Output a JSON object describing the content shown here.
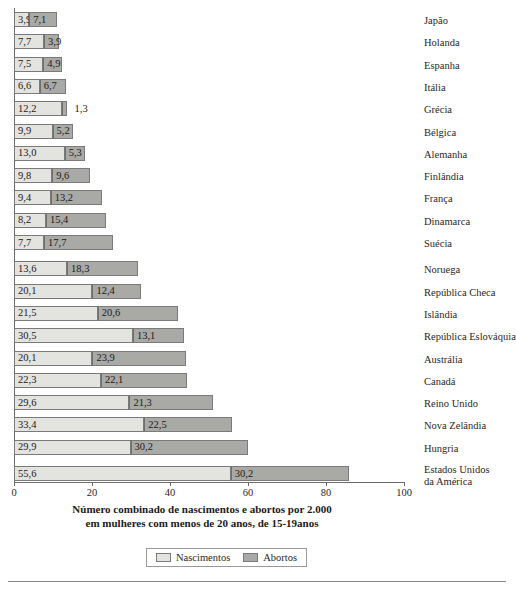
{
  "chart_data": {
    "type": "bar",
    "orientation": "horizontal",
    "stacked": true,
    "title": "",
    "xlabel": "Número combinado de nascimentos e abortos por 2.000 em mulheres com menos de 20 anos, de 15-19anos",
    "xlabel_line1": "Número combinado de nascimentos e abortos por 2.000",
    "xlabel_line2": "em mulheres com menos de 20 anos, de 15-19anos",
    "ylabel": "",
    "xlim": [
      0,
      100
    ],
    "xticks": [
      0,
      20,
      40,
      60,
      80,
      100
    ],
    "grid": false,
    "legend_position": "bottom",
    "colors": {
      "births": "#e3e3e0",
      "abortions": "#a9a9a6",
      "border": "#7a7a78",
      "axis": "#6e6a67",
      "text": "#2b2726"
    },
    "categories": [
      "Japão",
      "Holanda",
      "Espanha",
      "Itália",
      "Grécia",
      "Bélgica",
      "Alemanha",
      "Finlândia",
      "França",
      "Dinamarca",
      "Suécia",
      "Noruega",
      "República Checa",
      "Islândia",
      "República Eslováquia",
      "Austrália",
      "Canadá",
      "Reino Unido",
      "Nova Zelândia",
      "Hungria",
      "Estados Unidos da América"
    ],
    "series": [
      {
        "name": "Nascimentos",
        "values": [
          3.9,
          7.7,
          7.5,
          6.6,
          12.2,
          9.9,
          13.0,
          9.8,
          9.4,
          8.2,
          7.7,
          13.6,
          20.1,
          21.5,
          30.5,
          20.1,
          22.3,
          29.6,
          33.4,
          29.9,
          55.6
        ],
        "labels": [
          "3,9",
          "7,7",
          "7,5",
          "6,6",
          "12,2",
          "9,9",
          "13,0",
          "9,8",
          "9,4",
          "8,2",
          "7,7",
          "13,6",
          "20,1",
          "21,5",
          "30,5",
          "20,1",
          "22,3",
          "29,6",
          "33,4",
          "29,9",
          "55,6"
        ]
      },
      {
        "name": "Abortos",
        "values": [
          7.1,
          3.9,
          4.9,
          6.7,
          1.3,
          5.2,
          5.3,
          9.6,
          13.2,
          15.4,
          17.7,
          18.3,
          12.4,
          20.6,
          13.1,
          23.9,
          22.1,
          21.3,
          22.5,
          30.2,
          30.2
        ],
        "labels": [
          "7,1",
          "3,9",
          "4,9",
          "6,7",
          "1,3",
          "5,2",
          "5,3",
          "9,6",
          "13,2",
          "15,4",
          "17,7",
          "18,3",
          "12,4",
          "20,6",
          "13,1",
          "23,9",
          "22,1",
          "21,3",
          "22,5",
          "30,2",
          "30,2"
        ]
      }
    ],
    "rows": [
      {
        "country": "Japão",
        "country_line2": "",
        "births": 3.9,
        "abortions": 7.1,
        "births_label": "3,9",
        "abortions_label": "7,1",
        "abortions_label_outside": false
      },
      {
        "country": "Holanda",
        "country_line2": "",
        "births": 7.7,
        "abortions": 3.9,
        "births_label": "7,7",
        "abortions_label": "3,9",
        "abortions_label_outside": false
      },
      {
        "country": "Espanha",
        "country_line2": "",
        "births": 7.5,
        "abortions": 4.9,
        "births_label": "7,5",
        "abortions_label": "4,9",
        "abortions_label_outside": false
      },
      {
        "country": "Itália",
        "country_line2": "",
        "births": 6.6,
        "abortions": 6.7,
        "births_label": "6,6",
        "abortions_label": "6,7",
        "abortions_label_outside": false
      },
      {
        "country": "Grécia",
        "country_line2": "",
        "births": 12.2,
        "abortions": 1.3,
        "births_label": "12,2",
        "abortions_label": "1,3",
        "abortions_label_outside": true
      },
      {
        "country": "Bélgica",
        "country_line2": "",
        "births": 9.9,
        "abortions": 5.2,
        "births_label": "9,9",
        "abortions_label": "5,2",
        "abortions_label_outside": false
      },
      {
        "country": "Alemanha",
        "country_line2": "",
        "births": 13.0,
        "abortions": 5.3,
        "births_label": "13,0",
        "abortions_label": "5,3",
        "abortions_label_outside": false
      },
      {
        "country": "Finlândia",
        "country_line2": "",
        "births": 9.8,
        "abortions": 9.6,
        "births_label": "9,8",
        "abortions_label": "9,6",
        "abortions_label_outside": false
      },
      {
        "country": "França",
        "country_line2": "",
        "births": 9.4,
        "abortions": 13.2,
        "births_label": "9,4",
        "abortions_label": "13,2",
        "abortions_label_outside": false
      },
      {
        "country": "Dinamarca",
        "country_line2": "",
        "births": 8.2,
        "abortions": 15.4,
        "births_label": "8,2",
        "abortions_label": "15,4",
        "abortions_label_outside": false
      },
      {
        "country": "Suécia",
        "country_line2": "",
        "births": 7.7,
        "abortions": 17.7,
        "births_label": "7,7",
        "abortions_label": "17,7",
        "abortions_label_outside": false
      },
      {
        "country": "Noruega",
        "country_line2": "",
        "births": 13.6,
        "abortions": 18.3,
        "births_label": "13,6",
        "abortions_label": "18,3",
        "abortions_label_outside": false
      },
      {
        "country": "República Checa",
        "country_line2": "",
        "births": 20.1,
        "abortions": 12.4,
        "births_label": "20,1",
        "abortions_label": "12,4",
        "abortions_label_outside": false
      },
      {
        "country": "Islândia",
        "country_line2": "",
        "births": 21.5,
        "abortions": 20.6,
        "births_label": "21,5",
        "abortions_label": "20,6",
        "abortions_label_outside": false
      },
      {
        "country": "República Eslováquia",
        "country_line2": "",
        "births": 30.5,
        "abortions": 13.1,
        "births_label": "30,5",
        "abortions_label": "13,1",
        "abortions_label_outside": false
      },
      {
        "country": "Austrália",
        "country_line2": "",
        "births": 20.1,
        "abortions": 23.9,
        "births_label": "20,1",
        "abortions_label": "23,9",
        "abortions_label_outside": false
      },
      {
        "country": "Canadá",
        "country_line2": "",
        "births": 22.3,
        "abortions": 22.1,
        "births_label": "22,3",
        "abortions_label": "22,1",
        "abortions_label_outside": false
      },
      {
        "country": "Reino Unido",
        "country_line2": "",
        "births": 29.6,
        "abortions": 21.3,
        "births_label": "29,6",
        "abortions_label": "21,3",
        "abortions_label_outside": false
      },
      {
        "country": "Nova Zelândia",
        "country_line2": "",
        "births": 33.4,
        "abortions": 22.5,
        "births_label": "33,4",
        "abortions_label": "22,5",
        "abortions_label_outside": false
      },
      {
        "country": "Hungria",
        "country_line2": "",
        "births": 29.9,
        "abortions": 30.2,
        "births_label": "29,9",
        "abortions_label": "30,2",
        "abortions_label_outside": false
      },
      {
        "country": "Estados Unidos",
        "country_line2": "da América",
        "births": 55.6,
        "abortions": 30.2,
        "births_label": "55,6",
        "abortions_label": "30,2",
        "abortions_label_outside": false
      }
    ]
  },
  "legend": {
    "items": [
      {
        "label": "Nascimentos",
        "key": "births"
      },
      {
        "label": "Abortos",
        "key": "abortions"
      }
    ]
  }
}
